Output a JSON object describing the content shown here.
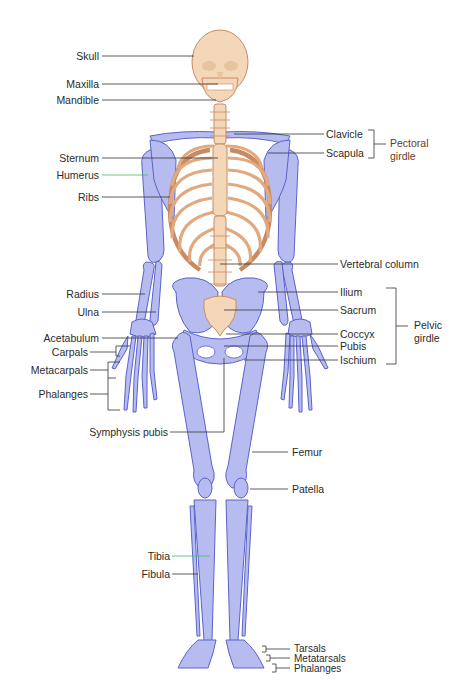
{
  "diagram": {
    "colors": {
      "axial_bone": "#f2cfae",
      "axial_outline": "#c98a62",
      "appendicular_bone": "#b7bcf0",
      "appendicular_outline": "#5a63c9",
      "leader_line": "#333333",
      "leader_line_green": "#3fbf5a",
      "label_text": "#2b2b2b",
      "pectoral_text": "#6b3a2a"
    },
    "left_labels": [
      {
        "text": "Skull"
      },
      {
        "text": "Maxilla"
      },
      {
        "text": "Mandible"
      },
      {
        "text": "Sternum"
      },
      {
        "text": "Humerus"
      },
      {
        "text": "Ribs"
      },
      {
        "text": "Radius"
      },
      {
        "text": "Ulna"
      },
      {
        "text": "Acetabulum"
      },
      {
        "text": "Carpals"
      },
      {
        "text": "Metacarpals"
      },
      {
        "text": "Phalanges"
      },
      {
        "text": "Symphysis pubis"
      },
      {
        "text": "Tibia"
      },
      {
        "text": "Fibula"
      }
    ],
    "right_labels": [
      {
        "text": "Clavicle"
      },
      {
        "text": "Scapula"
      },
      {
        "text": "Vertebral column"
      },
      {
        "text": "Ilium"
      },
      {
        "text": "Sacrum"
      },
      {
        "text": "Coccyx"
      },
      {
        "text": "Pubis"
      },
      {
        "text": "Ischium"
      },
      {
        "text": "Femur"
      },
      {
        "text": "Patella"
      },
      {
        "text": "Tarsals"
      },
      {
        "text": "Metatarsals"
      },
      {
        "text": "Phalanges"
      }
    ],
    "groups": {
      "pectoral": {
        "line1": "Pectoral",
        "line2": "girdle"
      },
      "pelvic": {
        "line1": "Pelvic",
        "line2": "girdle"
      }
    }
  }
}
